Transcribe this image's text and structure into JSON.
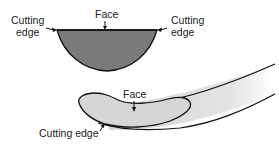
{
  "diagram": {
    "type": "curette-blade-anatomy",
    "cross_section": {
      "labels": {
        "face": "Face",
        "cutting_edge_left_line1": "Cutting",
        "cutting_edge_left_line2": "edge",
        "cutting_edge_right_line1": "Cutting",
        "cutting_edge_right_line2": "edge"
      },
      "fill_color": "#7a7a7a",
      "stroke_color": "#111111"
    },
    "side_view": {
      "labels": {
        "face": "Face",
        "cutting_edge": "Cutting edge"
      },
      "fill_color": "#d6d6d6",
      "stroke_color": "#111111"
    }
  }
}
